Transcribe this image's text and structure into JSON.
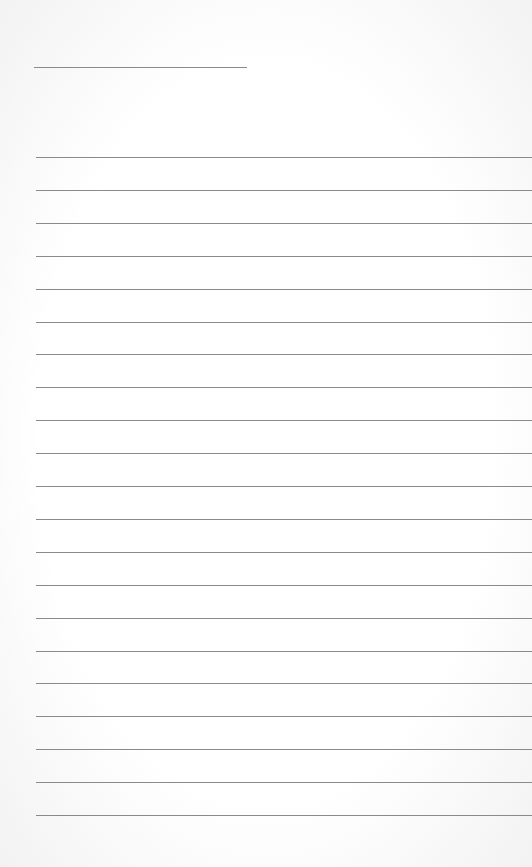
{
  "document": {
    "type": "lined-paper",
    "title_line": {
      "x": 34,
      "y": 67,
      "width": 213
    },
    "ruled_lines": {
      "count": 21,
      "start_y": 157,
      "spacing": 32.9,
      "x": 36
    },
    "line_color": "#8a8a8a",
    "background": "#ffffff"
  }
}
